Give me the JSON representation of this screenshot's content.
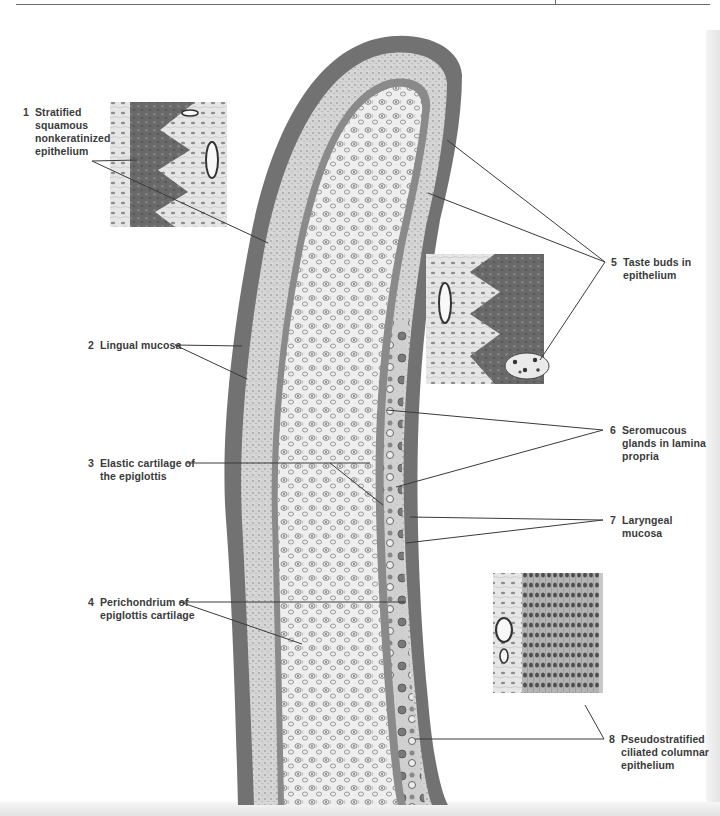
{
  "figure": {
    "labels": [
      {
        "number": "1",
        "lines": [
          "Stratified",
          "squamous",
          "nonkeratinized",
          "epithelium"
        ]
      },
      {
        "number": "2",
        "lines": [
          "Lingual mucosa"
        ]
      },
      {
        "number": "3",
        "lines": [
          "Elastic cartilage of",
          "the epiglottis"
        ]
      },
      {
        "number": "4",
        "lines": [
          "Perichondrium of",
          "epiglottis cartilage"
        ]
      },
      {
        "number": "5",
        "lines": [
          "Taste buds in",
          "epithelium"
        ]
      },
      {
        "number": "6",
        "lines": [
          "Seromucous",
          "glands in lamina",
          "propria"
        ]
      },
      {
        "number": "7",
        "lines": [
          "Laryngeal",
          "mucosa"
        ]
      },
      {
        "number": "8",
        "lines": [
          "Pseudostratified",
          "ciliated columnar",
          "epithelium"
        ]
      }
    ],
    "insets": [
      {
        "name": "stratified-squamous-inset",
        "depicts": "Stratified squamous nonkeratinized epithelium with blood vessel"
      },
      {
        "name": "taste-bud-inset",
        "depicts": "Taste bud in epithelium with blood vessel"
      },
      {
        "name": "pseudostratified-inset",
        "depicts": "Pseudostratified ciliated columnar epithelium with blood vessel"
      }
    ],
    "colors": {
      "epithelium": "#6e6e6e",
      "lamina_propria": "#d8d8d8",
      "cartilage": "#ececec",
      "leader_line": "#3a3a3a",
      "label_text": "#3a3a3a"
    }
  }
}
